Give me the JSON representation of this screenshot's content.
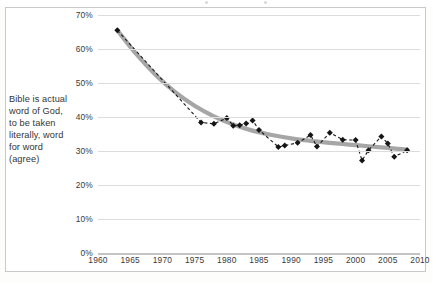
{
  "figure": {
    "category_label": "Bible is actual word of God, to be taken literally, word for word (agree)"
  },
  "chart_data": {
    "type": "line",
    "title": "",
    "subtitle": "",
    "xlabel": "",
    "ylabel": "",
    "xlim": [
      1960,
      2010
    ],
    "ylim": [
      0,
      70
    ],
    "grid": true,
    "legend": false,
    "x_ticks": [
      "1960",
      "1965",
      "1970",
      "1975",
      "1980",
      "1985",
      "1990",
      "1995",
      "2000",
      "2005",
      "2010"
    ],
    "x_tick_values": [
      1960,
      1965,
      1970,
      1975,
      1980,
      1985,
      1990,
      1995,
      2000,
      2005,
      2010
    ],
    "y_ticks": [
      "0%",
      "10%",
      "20%",
      "30%",
      "40%",
      "50%",
      "60%",
      "70%"
    ],
    "y_tick_values": [
      0,
      10,
      20,
      30,
      40,
      50,
      60,
      70
    ],
    "series": [
      {
        "name": "Bible is actual word of God, to be taken literally, word for word (agree)",
        "style": "dashed-with-diamond-markers",
        "color": "#151515",
        "x": [
          1963,
          1976,
          1978,
          1980,
          1981,
          1982,
          1983,
          1984,
          1985,
          1988,
          1989,
          1991,
          1993,
          1994,
          1996,
          1998,
          2000,
          2001,
          2002,
          2004,
          2005,
          2006,
          2008
        ],
        "y": [
          65.5,
          38.4,
          38.0,
          39.7,
          37.4,
          37.6,
          38.1,
          39.0,
          36.2,
          31.2,
          31.6,
          32.4,
          34.7,
          31.3,
          35.4,
          33.3,
          33.2,
          27.2,
          30.2,
          34.3,
          32.2,
          28.3,
          30.2
        ]
      },
      {
        "name": "trend",
        "style": "thick-gray-smooth-curve",
        "color": "#a6a6a6",
        "x": [
          1963,
          1966,
          1969,
          1972,
          1975,
          1978,
          1981,
          1984,
          1987,
          1990,
          1993,
          1996,
          1999,
          2002,
          2005,
          2008
        ],
        "y": [
          65.5,
          58.4,
          52.3,
          47.3,
          43.3,
          40.2,
          37.8,
          36.0,
          34.7,
          33.7,
          33.0,
          32.4,
          31.9,
          31.4,
          30.9,
          30.4
        ]
      }
    ]
  }
}
